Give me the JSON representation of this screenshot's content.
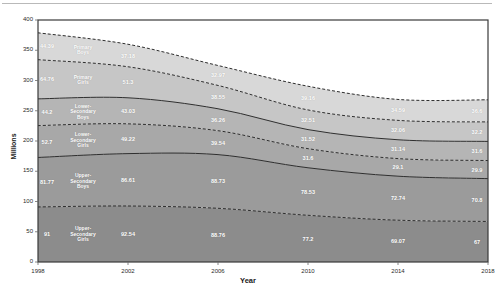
{
  "chart_data": {
    "type": "area",
    "stacked": true,
    "title": "",
    "xlabel": "Year",
    "ylabel": "Millions",
    "x": [
      1998,
      2002,
      2006,
      2010,
      2014,
      2018
    ],
    "xtick_labels": [
      "1998",
      "2002",
      "2006",
      "2010",
      "2014",
      "2018"
    ],
    "ytick_labels": [
      "0",
      "50",
      "100",
      "150",
      "200",
      "250",
      "300",
      "350",
      "400"
    ],
    "ytick_values": [
      0,
      50,
      100,
      150,
      200,
      250,
      300,
      350,
      400
    ],
    "ylim": [
      0,
      400
    ],
    "xlim": [
      1998,
      2018
    ],
    "grid": false,
    "legend_position": "inline-labels",
    "series": [
      {
        "name": "Upper-Secondary Girls",
        "color": "#8c8c8c",
        "edge": "dashed",
        "values": [
          91,
          92.54,
          88.76,
          77.2,
          69.07,
          67
        ],
        "labels": [
          "91",
          "92.54",
          "88.76",
          "77.2",
          "69.07",
          "67"
        ]
      },
      {
        "name": "Upper-Secondary Boys",
        "color": "#9b9b9b",
        "edge": "solid",
        "values": [
          81.77,
          86.61,
          88.73,
          78.53,
          72.74,
          70.8
        ],
        "labels": [
          "81.77",
          "86.61",
          "88.73",
          "78.53",
          "72.74",
          "70.8"
        ]
      },
      {
        "name": "Lower-Secondary Girls",
        "color": "#a8a8a8",
        "edge": "dashed",
        "values": [
          52.7,
          49.22,
          39.54,
          31.6,
          29.1,
          29.9
        ],
        "labels": [
          "52.7",
          "49.22",
          "39.54",
          "31.6",
          "29.1",
          "29.9"
        ]
      },
      {
        "name": "Lower-Secondary Boys",
        "color": "#b5b5b5",
        "edge": "solid",
        "values": [
          44.2,
          43.03,
          36.26,
          31.52,
          31.14,
          31.6
        ],
        "labels": [
          "44.2",
          "43.03",
          "36.26",
          "31.52",
          "31.14",
          "31.6"
        ]
      },
      {
        "name": "Primary Girls",
        "color": "#c6c6c6",
        "edge": "dashed",
        "values": [
          64.76,
          51.3,
          38.55,
          32.51,
          32.06,
          32.2
        ],
        "labels": [
          "64.76",
          "51.3",
          "38.55",
          "32.51",
          "32.06",
          "32.2"
        ]
      },
      {
        "name": "Primary Boys",
        "color": "#d8d8d8",
        "edge": "dashed",
        "values": [
          44.39,
          37.18,
          32.97,
          39.16,
          34.59,
          36.6
        ],
        "labels": [
          "44.39",
          "37.18",
          "32.97",
          "39.16",
          "34.59",
          "36.6"
        ]
      }
    ]
  },
  "axes": {
    "y_axis_title": "Millions",
    "x_axis_title": "Year"
  },
  "colors": {
    "plot_border": "#3a3a3a",
    "background": "#ffffff",
    "tick_text": "#2b2b2b",
    "data_label_text": "#ffffff"
  }
}
